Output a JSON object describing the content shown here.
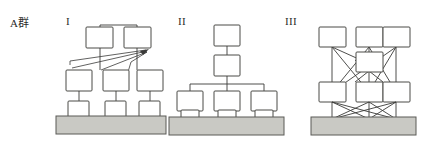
{
  "figure": {
    "group_label": "A群",
    "panels": [
      {
        "id": "panel-1",
        "numeral": "I",
        "structure": "hierarchical-with-feedback-arrows",
        "rows": [
          {
            "name": "top-row",
            "box_count": 2
          },
          {
            "name": "middle-row",
            "box_count": 3
          },
          {
            "name": "lower-row",
            "box_count": 3
          },
          {
            "name": "base",
            "box_count": 1
          }
        ],
        "arrow_count": 3,
        "arrow_target": "top-right-node"
      },
      {
        "id": "panel-2",
        "numeral": "II",
        "structure": "pyramid-tree",
        "rows": [
          {
            "name": "apex",
            "box_count": 1
          },
          {
            "name": "second",
            "box_count": 1
          },
          {
            "name": "third-row",
            "box_count": 3
          },
          {
            "name": "lower-row",
            "box_count": 3
          },
          {
            "name": "base",
            "box_count": 1
          }
        ]
      },
      {
        "id": "panel-3",
        "numeral": "III",
        "structure": "fully-connected-mesh",
        "rows": [
          {
            "name": "top-row",
            "box_count": 3
          },
          {
            "name": "center",
            "box_count": 1
          },
          {
            "name": "middle-row",
            "box_count": 3
          },
          {
            "name": "base",
            "box_count": 1
          }
        ]
      }
    ]
  },
  "colors": {
    "base_fill": "#c9c9c4",
    "node_fill": "#ffffff",
    "stroke": "#4a4a46",
    "text": "#2b2b2b",
    "background": "#ffffff"
  }
}
